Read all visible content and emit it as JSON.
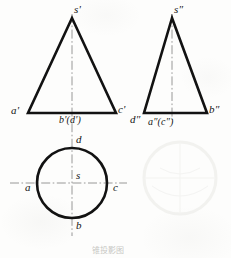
{
  "figure": {
    "background_color": "#fdfdfc",
    "line_color": "#121212",
    "centerline_color": "#8d8d8d",
    "ghost_color": "#e3e3e0",
    "caption": "锥投影图"
  },
  "front_view": {
    "name": "front-view-triangle",
    "apex_label": "s'",
    "base_left_label": "a'",
    "base_center_label": "b'(d')",
    "base_right_label": "c'",
    "geometry": {
      "apex_x": 72,
      "apex_y": 18,
      "base_y": 113,
      "base_left_x": 28,
      "base_right_x": 116
    }
  },
  "side_view": {
    "name": "side-view-triangle",
    "apex_label": "s″",
    "base_left_label": "d″",
    "base_center_label": "a″(c″)",
    "base_right_label": "b″",
    "geometry": {
      "apex_x": 172,
      "apex_y": 18,
      "base_y": 113,
      "base_left_x": 144,
      "base_right_x": 207
    }
  },
  "top_view": {
    "name": "top-view-circle",
    "center_label": "s",
    "top_label": "d",
    "bottom_label": "b",
    "left_label": "a",
    "right_label": "c",
    "geometry": {
      "center_x": 72,
      "center_y": 183,
      "radius": 35
    }
  },
  "centerlines": {
    "vertical_front": {
      "x": 72,
      "y1": 14,
      "y2": 236
    },
    "vertical_side": {
      "x": 172,
      "y1": 14,
      "y2": 120
    },
    "horizontal_top": {
      "y": 183,
      "x1": 10,
      "x2": 127
    }
  },
  "ghost_circle": {
    "name": "ghost-circle-bleedthrough",
    "center_x": 180,
    "center_y": 178,
    "radius": 36
  }
}
